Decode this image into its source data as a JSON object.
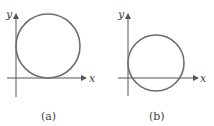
{
  "figure": {
    "panels": [
      {
        "id": "a",
        "caption": "(a)",
        "x_axis_label": "x",
        "y_axis_label": "y",
        "description": "Circle tangent to both the x-axis and the y-axis, lying in the first quadrant"
      },
      {
        "id": "b",
        "caption": "(b)",
        "x_axis_label": "x",
        "y_axis_label": "y",
        "description": "Circle passing through the origin, crossing the x-axis, center in first quadrant"
      }
    ],
    "colors": {
      "circle": "#6e6e6e",
      "axes": "#555555",
      "text": "#444444"
    }
  }
}
